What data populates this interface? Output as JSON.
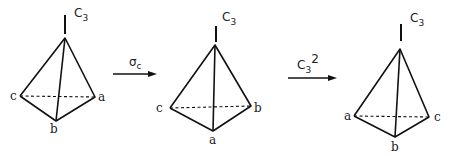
{
  "diagram": {
    "axis_label": {
      "main": "C",
      "sub": "3"
    },
    "figures": [
      {
        "name": "initial",
        "vertices": {
          "left": "c",
          "right": "a",
          "front": "b"
        }
      },
      {
        "name": "after-sigma-c",
        "vertices": {
          "left": "c",
          "right": "b",
          "front": "a"
        }
      },
      {
        "name": "after-c3-squared",
        "vertices": {
          "left": "a",
          "right": "c",
          "front": "b"
        }
      }
    ],
    "operations": [
      {
        "symbol": "σ",
        "sub": "c",
        "sup": ""
      },
      {
        "symbol": "C",
        "sub": "3",
        "sup": "2"
      }
    ]
  }
}
